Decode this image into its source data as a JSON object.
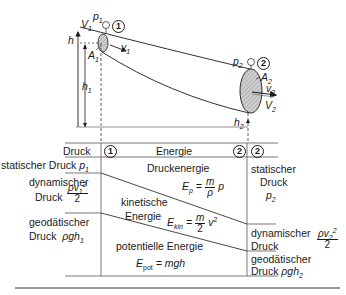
{
  "figure": {
    "top_labels": {
      "p1": "p",
      "p1_sub": "1",
      "station1": "1",
      "V1dot": "V",
      "V1dot_sub": "1",
      "v1": "v",
      "v1_sub": "1",
      "A1": "A",
      "A1_sub": "1",
      "h": "h",
      "h1": "h",
      "h1_sub": "1",
      "p2": "p",
      "p2_sub": "2",
      "station2": "2",
      "A2": "A",
      "A2_sub": "2",
      "v2": "v",
      "v2_sub": "2",
      "V2dot": "V",
      "V2dot_sub": "2",
      "h2": "h",
      "h2_sub": "2"
    },
    "table": {
      "header": {
        "left": "Druck",
        "station1": "1",
        "middle": "Energie",
        "station2_left": "2",
        "station2_right": "2"
      },
      "left_column": {
        "static_pressure": "statischer Druck",
        "static_symbol": "p",
        "static_sub": "1",
        "dynamic_label_1": "dynamischer",
        "dynamic_label_2": "Druck",
        "dynamic_num": "ρv",
        "dynamic_num_sub": "1",
        "dynamic_num_sup": "2",
        "dynamic_den": "2",
        "geodetic_label_1": "geodätischer",
        "geodetic_label_2": "Druck",
        "geodetic_symbol": "ρgh",
        "geodetic_sub": "1"
      },
      "middle_column": {
        "pressure_energy": "Druckenergie",
        "pressure_formula_lhs": "E",
        "pressure_formula_sub": "p",
        "pressure_formula_num": "m",
        "pressure_formula_den": "ρ",
        "pressure_formula_rhs": "p",
        "kinetic_label_1": "kinetische",
        "kinetic_label_2": "Energie",
        "kinetic_formula_lhs": "E",
        "kinetic_formula_sub": "kin",
        "kinetic_formula_num": "m",
        "kinetic_formula_den": "2",
        "kinetic_formula_rhs": "v",
        "kinetic_formula_sup": "2",
        "potential_label": "potentielle Energie",
        "potential_formula_lhs": "E",
        "potential_formula_sub": "pot",
        "potential_formula_rhs": "= mgh"
      },
      "right_column": {
        "static_1": "statischer",
        "static_2": "Druck",
        "static_symbol": "p",
        "static_sub": "2",
        "dynamic_label_1": "dynamischer",
        "dynamic_label_2": "Druck",
        "dynamic_num": "ρv",
        "dynamic_num_sub": "2",
        "dynamic_num_sup": "2",
        "dynamic_den": "2",
        "geodetic_label_1": "geodätischer",
        "geodetic_label_2": "Druck",
        "geodetic_symbol": "ρgh",
        "geodetic_sub": "2"
      }
    },
    "colors": {
      "line": "#1a1a1a",
      "grid": "#555555",
      "fill": "#c8c8c8"
    }
  }
}
